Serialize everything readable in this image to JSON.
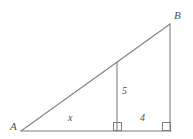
{
  "figure": {
    "kind": "geometry-diagram",
    "stroke_color": "#7f7f7f",
    "label_color": "#4d4d4d",
    "background_color": "#ffffff",
    "width": 193,
    "height": 139
  },
  "vertices": {
    "A": {
      "label": "A",
      "x": 21,
      "y": 131
    },
    "B": {
      "label": "B",
      "x": 170,
      "y": 24
    },
    "C": {
      "label": "",
      "x": 170,
      "y": 131
    },
    "D": {
      "label": "",
      "x": 117,
      "y": 131
    },
    "E": {
      "label": "",
      "x": 117,
      "y": 62
    }
  },
  "segments": [
    {
      "name": "base-AC",
      "from": "A",
      "to": "C"
    },
    {
      "name": "hypotenuse-AB",
      "from": "A",
      "to": "B"
    },
    {
      "name": "vertical-BC",
      "from": "B",
      "to": "C"
    },
    {
      "name": "altitude-ED",
      "from": "E",
      "to": "D"
    }
  ],
  "measures": {
    "base_left": "x",
    "base_right": "4",
    "altitude": "5"
  },
  "right_angles": [
    {
      "name": "right-angle-at-D",
      "x": 113,
      "y": 123,
      "size": 8
    },
    {
      "name": "right-angle-at-C",
      "x": 162,
      "y": 123,
      "size": 8
    }
  ]
}
